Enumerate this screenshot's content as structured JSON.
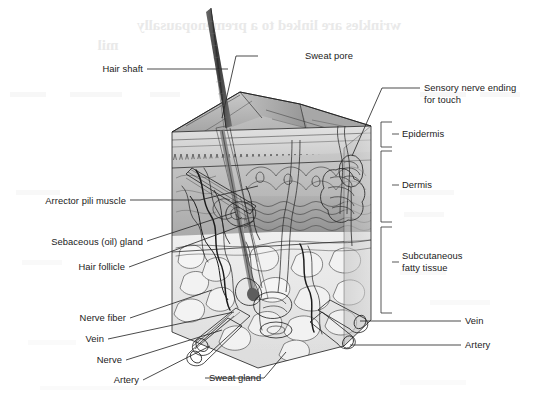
{
  "figure": {
    "background_color": "#ffffff",
    "ink_color": "#1b1b1b"
  },
  "bleed_through": {
    "line1": "wrinkles are linked to a premenopausally",
    "line2": "mil",
    "note": "faint mirrored show-through from reverse side of page"
  },
  "labels_left": [
    {
      "id": "hair-shaft",
      "text": "Hair shaft",
      "x": 143,
      "y": 72,
      "leader": "M147,69 L228,69"
    },
    {
      "id": "arrector-pili",
      "text": "Arrector pili muscle",
      "x": 126,
      "y": 204,
      "leader": "M130,200 L253,200"
    },
    {
      "id": "sebaceous-gland",
      "text": "Sebaceous (oil) gland",
      "x": 143,
      "y": 245,
      "leader": "M147,241 L253,219"
    },
    {
      "id": "hair-follicle",
      "text": "Hair follicle",
      "x": 125,
      "y": 270,
      "leader": "M129,267 L254,250"
    },
    {
      "id": "nerve-fiber",
      "text": "Nerve fiber",
      "x": 126,
      "y": 321,
      "leader": "M130,318 L248,302"
    },
    {
      "id": "vein-left",
      "text": "Vein",
      "x": 104,
      "y": 342,
      "leader": "M108,339 L232,318"
    },
    {
      "id": "nerve",
      "text": "Nerve",
      "x": 122,
      "y": 363,
      "leader": "M126,360 L218,336"
    },
    {
      "id": "artery-left",
      "text": "Artery",
      "x": 139,
      "y": 383,
      "leader": "M143,380 L206,348"
    }
  ],
  "labels_right": [
    {
      "id": "sweat-pore",
      "text": "Sweat pore",
      "x": 305,
      "y": 59,
      "leader": "M258,56 L302,56"
    },
    {
      "id": "sensory-nerve",
      "text": "Sensory nerve ending",
      "x": 424,
      "y": 91,
      "leader": "M380,88 L420,88"
    },
    {
      "id": "sensory-nerve-2",
      "text": "for touch",
      "x": 424,
      "y": 103,
      "leader": ""
    },
    {
      "id": "vein-right",
      "text": "Vein",
      "x": 465,
      "y": 324,
      "leader": "M367,321 L461,321"
    },
    {
      "id": "artery-right",
      "text": "Artery",
      "x": 465,
      "y": 348,
      "leader": "M357,345 L461,345"
    }
  ],
  "labels_bottom": [
    {
      "id": "sweat-gland",
      "text": "Sweat gland",
      "x": 209,
      "y": 381,
      "leader": "M270,375 L286,350"
    }
  ],
  "layer_brackets": [
    {
      "id": "epidermis",
      "text": "Epidermis",
      "label_x": 402,
      "label_y": 134,
      "bracket": "M392,122 L381,122 L381,147 L392,147",
      "tick": "M392,134 L398,134"
    },
    {
      "id": "dermis",
      "text": "Dermis",
      "label_x": 402,
      "label_y": 185,
      "bracket": "M392,150 L381,150 L381,222 L392,222",
      "tick": "M392,185 L398,185"
    },
    {
      "id": "subcutaneous",
      "text": "Subcutaneous",
      "text2": "fatty tissue",
      "label_x": 402,
      "label_y": 256,
      "label2_y": 268,
      "bracket": "M392,226 L381,226 L381,312 L392,312",
      "tick": "M392,262 L398,262"
    }
  ],
  "anatomy_parts": [
    "hair-shaft",
    "sweat-pore",
    "epidermis-ridges",
    "dermis-matrix",
    "subcutaneous-fat-lobules",
    "hair-follicle",
    "sebaceous-gland",
    "arrector-pili-muscle",
    "sweat-gland-coil",
    "sweat-duct",
    "sensory-nerve-corpuscle",
    "blood-vessels",
    "nerve-bundle"
  ],
  "palette": {
    "skin_top_light": "#cfcfcf",
    "skin_top_mid": "#b8b8b8",
    "skin_top_dark": "#9d9d9d",
    "epidermis_band": "#d8d8d8",
    "dermis_band": "#c2c2c2",
    "dermis_deep": "#a9a9a9",
    "fat_layer": "#ececec",
    "fat_lobule": "#f4f4f4",
    "hair_dark": "#4a4a4a",
    "vessel": "#b5b5b5",
    "outline": "#1e1e1e"
  }
}
